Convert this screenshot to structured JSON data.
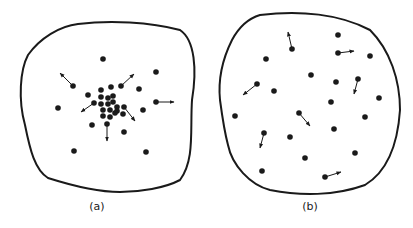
{
  "panels": [
    {
      "id": "a",
      "label": "(a)",
      "label_pos": [
        97,
        210
      ],
      "outline": "M78,24 C110,20 150,22 180,30 C195,40 197,70 192,100 C190,130 195,160 180,180 C165,188 140,192 120,192 C95,192 70,185 48,178 C35,170 30,150 25,125 C18,100 20,70 28,55 C40,38 60,26 78,24 Z",
      "dots": [
        [
          103,
          59
        ],
        [
          156,
          72
        ],
        [
          73,
          86
        ],
        [
          121,
          86
        ],
        [
          139,
          89
        ],
        [
          88,
          95
        ],
        [
          101,
          90
        ],
        [
          111,
          87
        ],
        [
          58,
          108
        ],
        [
          94,
          103
        ],
        [
          156,
          102
        ],
        [
          101,
          97
        ],
        [
          108,
          98
        ],
        [
          113,
          96
        ],
        [
          101,
          104
        ],
        [
          108,
          104
        ],
        [
          113,
          102
        ],
        [
          117,
          107
        ],
        [
          124,
          107
        ],
        [
          103,
          110
        ],
        [
          110,
          110
        ],
        [
          117,
          111
        ],
        [
          123,
          114
        ],
        [
          103,
          116
        ],
        [
          110,
          117
        ],
        [
          115,
          113
        ],
        [
          107,
          124
        ],
        [
          92,
          125
        ],
        [
          124,
          132
        ],
        [
          74,
          151
        ],
        [
          146,
          152
        ],
        [
          143,
          110
        ]
      ],
      "arrows": [
        [
          73,
          86,
          60,
          73
        ],
        [
          121,
          86,
          134,
          74
        ],
        [
          94,
          103,
          81,
          112
        ],
        [
          156,
          102,
          174,
          102
        ],
        [
          124,
          107,
          135,
          121
        ],
        [
          107,
          124,
          107,
          141
        ]
      ]
    },
    {
      "id": "b",
      "label": "(b)",
      "label_pos": [
        310,
        210
      ],
      "outline": "M260,15 C300,10 340,14 370,30 C390,50 400,80 400,110 C398,140 390,170 365,185 C335,196 300,196 270,190 C250,185 232,165 228,145 C224,130 222,115 220,100 C218,80 222,60 232,40 C240,25 250,18 260,15 Z",
      "dots": [
        [
          338,
          35
        ],
        [
          292,
          49
        ],
        [
          338,
          53
        ],
        [
          370,
          56
        ],
        [
          266,
          59
        ],
        [
          311,
          75
        ],
        [
          336,
          82
        ],
        [
          358,
          79
        ],
        [
          257,
          84
        ],
        [
          274,
          91
        ],
        [
          379,
          98
        ],
        [
          331,
          102
        ],
        [
          235,
          116
        ],
        [
          299,
          113
        ],
        [
          365,
          117
        ],
        [
          334,
          129
        ],
        [
          264,
          133
        ],
        [
          290,
          137
        ],
        [
          355,
          153
        ],
        [
          305,
          158
        ],
        [
          262,
          171
        ],
        [
          325,
          177
        ]
      ],
      "arrows": [
        [
          292,
          49,
          288,
          32
        ],
        [
          338,
          53,
          354,
          51
        ],
        [
          257,
          84,
          243,
          95
        ],
        [
          358,
          79,
          354,
          94
        ],
        [
          299,
          113,
          310,
          126
        ],
        [
          264,
          133,
          260,
          148
        ],
        [
          325,
          177,
          341,
          172
        ]
      ]
    }
  ],
  "colors": {
    "ink": "#1a1a1a",
    "background": "#ffffff"
  }
}
